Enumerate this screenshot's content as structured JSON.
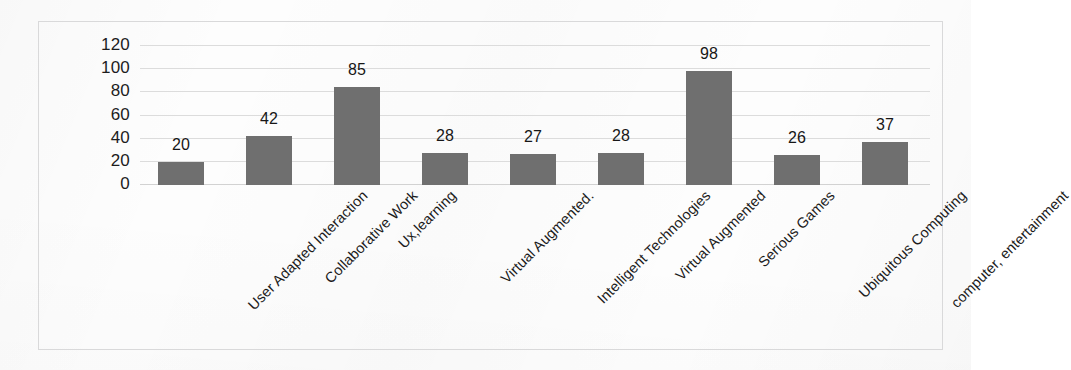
{
  "chart_data": {
    "type": "bar",
    "title": "",
    "subtitle": "",
    "xlabel": "",
    "ylabel": "",
    "ylim": [
      0,
      120
    ],
    "yticks": [
      "0",
      "20",
      "40",
      "60",
      "80",
      "100",
      "120"
    ],
    "grid": true,
    "legend": false,
    "legend_position": "none",
    "orientation": "vertical",
    "bar_color": "#6f6f6f",
    "gridline_color": "#dcdcdc",
    "border_color": "#d9d9da",
    "background_color": "#fdfdfd",
    "text_color": "#1b1b1b",
    "categories": [
      "User Adapted Interaction",
      "Collaborative Work",
      "Ux,learning",
      "Virtual Augmented.",
      "Intelligent Technologies",
      "Virtual Augmented",
      "Serious Games",
      "Ubiquitous Computing",
      "computer, entertainment"
    ],
    "values": [
      20,
      42,
      85,
      28,
      27,
      28,
      98,
      26,
      37
    ],
    "data_labels": [
      "20",
      "42",
      "85",
      "28",
      "27",
      "28",
      "98",
      "26",
      "37"
    ]
  }
}
